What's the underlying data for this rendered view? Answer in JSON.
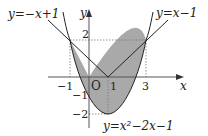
{
  "diagram": {
    "type": "function-graph",
    "colors": {
      "region_fill": "#a9a9a9",
      "curve_stroke": "#222222",
      "axis_stroke": "#555555",
      "guide_stroke": "#777777"
    },
    "axes": {
      "x_label": "x",
      "y_label": "y",
      "origin_label": "O"
    },
    "ticks": {
      "x": [
        {
          "value": -1,
          "label": "−1"
        },
        {
          "value": 1,
          "label": "1"
        },
        {
          "value": 3,
          "label": "3"
        }
      ],
      "y": [
        {
          "value": 2,
          "label": "2"
        },
        {
          "value": -1,
          "label": "−1"
        },
        {
          "value": -2,
          "label": "−2"
        }
      ]
    },
    "curves": [
      {
        "name": "line-negative",
        "equation": "y = −x + 1",
        "label": "y=−x+1"
      },
      {
        "name": "line-positive",
        "equation": "y = x − 1",
        "label": "y=x−1"
      },
      {
        "name": "parabola",
        "equation": "y = x² − 2x − 1",
        "label": "y=x²−2x−1"
      }
    ],
    "intersection_points": [
      {
        "x": -1,
        "y": 2
      },
      {
        "x": 1,
        "y": 0
      },
      {
        "x": 3,
        "y": 2
      }
    ],
    "shaded_region": "Region bounded above by y=−x+1 (for −1≤x≤1) and y=x−1 (for 1≤x≤3), and below by y=x²−2x−1"
  }
}
